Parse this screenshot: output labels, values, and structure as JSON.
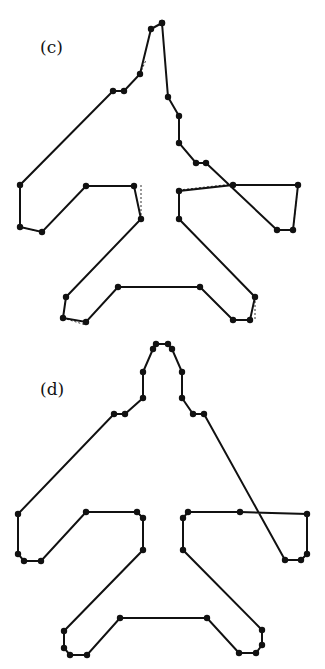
{
  "panels": [
    {
      "label": "(c)",
      "label_pos": [
        40,
        37
      ],
      "top": 0,
      "polygon": [
        [
          162,
          23
        ],
        [
          151,
          29
        ],
        [
          140,
          74
        ],
        [
          124,
          91
        ],
        [
          113,
          91
        ],
        [
          20,
          185
        ],
        [
          20,
          227
        ],
        [
          42,
          232
        ],
        [
          86,
          186
        ],
        [
          134,
          186
        ],
        [
          141,
          219
        ],
        [
          66,
          297
        ],
        [
          63,
          318
        ],
        [
          86,
          322
        ],
        [
          118,
          287
        ],
        [
          200,
          287
        ],
        [
          233,
          320
        ],
        [
          250,
          320
        ],
        [
          255,
          297
        ],
        [
          179,
          219
        ],
        [
          179,
          191
        ],
        [
          233,
          185
        ],
        [
          298,
          185
        ],
        [
          293,
          230
        ],
        [
          277,
          230
        ],
        [
          206,
          163
        ],
        [
          196,
          163
        ],
        [
          179,
          143
        ],
        [
          179,
          116
        ],
        [
          168,
          97
        ],
        [
          162,
          23
        ]
      ],
      "reference_dashed": [
        [
          [
            140,
            74
          ],
          [
            146,
            60
          ]
        ],
        [
          [
            141,
            185
          ],
          [
            141,
            219
          ]
        ],
        [
          [
            179,
            190
          ],
          [
            233,
            184
          ]
        ],
        [
          [
            298,
            185
          ],
          [
            293,
            230
          ]
        ],
        [
          [
            20,
            227
          ],
          [
            42,
            232
          ]
        ],
        [
          [
            255,
            297
          ],
          [
            255,
            320
          ]
        ],
        [
          [
            63,
            318
          ],
          [
            86,
            325
          ]
        ]
      ]
    },
    {
      "label": "(d)",
      "label_pos": [
        40,
        379
      ],
      "top": 0,
      "polygon": [
        [
          156,
          344
        ],
        [
          153,
          349
        ],
        [
          143,
          372
        ],
        [
          143,
          398
        ],
        [
          125,
          414
        ],
        [
          114,
          414
        ],
        [
          18,
          514
        ],
        [
          18,
          554
        ],
        [
          24,
          561
        ],
        [
          41,
          561
        ],
        [
          86,
          512
        ],
        [
          137,
          512
        ],
        [
          143,
          518
        ],
        [
          143,
          550
        ],
        [
          64,
          631
        ],
        [
          64,
          648
        ],
        [
          70,
          655
        ],
        [
          87,
          655
        ],
        [
          120,
          618
        ],
        [
          207,
          618
        ],
        [
          239,
          653
        ],
        [
          256,
          653
        ],
        [
          262,
          645
        ],
        [
          262,
          630
        ],
        [
          183,
          550
        ],
        [
          183,
          518
        ],
        [
          188,
          512
        ],
        [
          240,
          512
        ],
        [
          307,
          514
        ],
        [
          307,
          554
        ],
        [
          301,
          560
        ],
        [
          285,
          560
        ],
        [
          204,
          414
        ],
        [
          193,
          414
        ],
        [
          182,
          398
        ],
        [
          182,
          372
        ],
        [
          172,
          349
        ],
        [
          168,
          344
        ]
      ]
    }
  ],
  "chart_data": {
    "type": "diagram",
    "title": "",
    "panels": [
      "(c)",
      "(d)"
    ]
  }
}
